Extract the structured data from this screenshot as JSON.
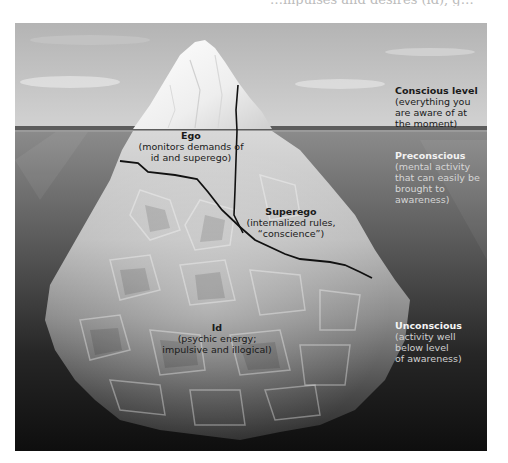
{
  "page": {
    "top_fragment": "…mpulses and desires (id), g…"
  },
  "diagram": {
    "levels": [
      {
        "id": "conscious",
        "title": "Conscious level",
        "lines": [
          "(everything you",
          "are aware of at",
          "the moment)"
        ]
      },
      {
        "id": "preconscious",
        "title": "Preconscious",
        "lines": [
          "(mental activity",
          "that can easily be",
          "brought to",
          "awareness)"
        ]
      },
      {
        "id": "unconscious",
        "title": "Unconscious",
        "lines": [
          "(activity well",
          "below level",
          "of awareness)"
        ]
      }
    ],
    "structures": [
      {
        "id": "ego",
        "title": "Ego",
        "lines": [
          "(monitors demands of",
          "id and superego)"
        ]
      },
      {
        "id": "superego",
        "title": "Superego",
        "lines": [
          "(internalized rules,",
          "“conscience”)"
        ]
      },
      {
        "id": "id",
        "title": "Id",
        "lines": [
          "(psychic energy;",
          "impulsive and illogical)"
        ]
      }
    ],
    "colors": {
      "sky_top": "#b9b9b9",
      "sky_bottom": "#d4d4d4",
      "waterline": "#5a5a5a",
      "water_top": "#8e8e8e",
      "water_bottom": "#111111",
      "ice_light": "#f4f4f4",
      "ice_dark": "#3a3a3a",
      "division_line": "#111111"
    }
  }
}
